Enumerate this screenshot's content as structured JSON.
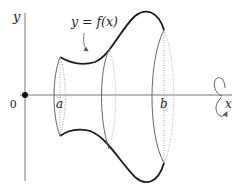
{
  "diagram": {
    "axes": {
      "x_label": "x",
      "y_label": "y",
      "origin_label": "0"
    },
    "curve_label": "y = f(x)",
    "bounds": {
      "a_label": "a",
      "b_label": "b"
    },
    "rotation_indicator": "rotation-about-x-axis",
    "colors": {
      "curve": "#1a1a1a",
      "axis": "#777777",
      "solid_outline": "#555555",
      "dotted": "#888888",
      "background": "#ffffff"
    }
  }
}
